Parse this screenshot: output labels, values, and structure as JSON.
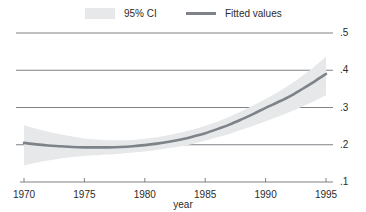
{
  "chart_data": {
    "type": "line",
    "title": "",
    "xlabel": "year",
    "ylabel": "",
    "xlim": [
      1970,
      1995
    ],
    "ylim": [
      0.1,
      0.5
    ],
    "xticks": [
      1970,
      1975,
      1980,
      1985,
      1990,
      1995
    ],
    "xtick_labels": [
      "1970",
      "1975",
      "1980",
      "1985",
      "1990",
      "1995"
    ],
    "yticks": [
      0.1,
      0.2,
      0.3,
      0.4,
      0.5
    ],
    "ytick_labels": [
      ".1",
      ".2",
      ".3",
      ".4",
      ".5"
    ],
    "grid": "horizontal",
    "legend_position": "top",
    "legend": [
      {
        "name": "95% CI",
        "kind": "band",
        "color": "#e6e8e9"
      },
      {
        "name": "Fitted values",
        "kind": "line",
        "color": "#7e838a"
      }
    ],
    "series": [
      {
        "name": "Fitted values",
        "color": "#7e838a",
        "x": [
          1970,
          1971,
          1972,
          1973,
          1974,
          1975,
          1976,
          1977,
          1978,
          1979,
          1980,
          1981,
          1982,
          1983,
          1984,
          1985,
          1986,
          1987,
          1988,
          1989,
          1990,
          1991,
          1992,
          1993,
          1994,
          1995
        ],
        "values": [
          0.205,
          0.201,
          0.198,
          0.196,
          0.194,
          0.193,
          0.193,
          0.193,
          0.194,
          0.196,
          0.199,
          0.203,
          0.208,
          0.214,
          0.222,
          0.231,
          0.242,
          0.254,
          0.268,
          0.283,
          0.299,
          0.314,
          0.33,
          0.349,
          0.369,
          0.39
        ]
      },
      {
        "name": "95% CI lower",
        "color": "#e6e8e9",
        "x": [
          1970,
          1971,
          1972,
          1973,
          1974,
          1975,
          1976,
          1977,
          1978,
          1979,
          1980,
          1981,
          1982,
          1983,
          1984,
          1985,
          1986,
          1987,
          1988,
          1989,
          1990,
          1991,
          1992,
          1993,
          1994,
          1995
        ],
        "values": [
          0.145,
          0.152,
          0.158,
          0.163,
          0.167,
          0.17,
          0.172,
          0.174,
          0.176,
          0.179,
          0.182,
          0.186,
          0.191,
          0.196,
          0.203,
          0.211,
          0.22,
          0.229,
          0.24,
          0.251,
          0.263,
          0.275,
          0.288,
          0.302,
          0.317,
          0.333
        ]
      },
      {
        "name": "95% CI upper",
        "color": "#e6e8e9",
        "x": [
          1970,
          1971,
          1972,
          1973,
          1974,
          1975,
          1976,
          1977,
          1978,
          1979,
          1980,
          1981,
          1982,
          1983,
          1984,
          1985,
          1986,
          1987,
          1988,
          1989,
          1990,
          1991,
          1992,
          1993,
          1994,
          1995
        ],
        "values": [
          0.253,
          0.243,
          0.235,
          0.228,
          0.222,
          0.217,
          0.214,
          0.212,
          0.212,
          0.213,
          0.216,
          0.22,
          0.226,
          0.233,
          0.241,
          0.251,
          0.262,
          0.275,
          0.29,
          0.306,
          0.323,
          0.341,
          0.361,
          0.384,
          0.409,
          0.437
        ]
      }
    ]
  },
  "axes": {
    "x_title": "year"
  }
}
